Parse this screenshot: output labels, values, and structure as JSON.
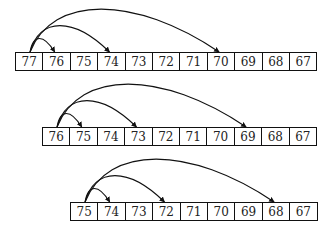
{
  "diagram": {
    "type": "array-jump-arcs",
    "cell_width": 27.4,
    "cell_height": 19,
    "colors": {
      "stroke": "#111111",
      "text": "#222222",
      "background": "#ffffff"
    },
    "rows": [
      {
        "x": 15,
        "y": 52,
        "values": [
          "77",
          "76",
          "75",
          "74",
          "73",
          "72",
          "71",
          "70",
          "69",
          "68",
          "67"
        ],
        "arcs_from_index": 0,
        "arcs_to_index": [
          1,
          3,
          7
        ]
      },
      {
        "x": 42,
        "y": 127,
        "values": [
          "76",
          "75",
          "74",
          "73",
          "72",
          "71",
          "70",
          "69",
          "68",
          "67"
        ],
        "arcs_from_index": 0,
        "arcs_to_index": [
          1,
          3,
          7
        ]
      },
      {
        "x": 70,
        "y": 202,
        "values": [
          "75",
          "74",
          "73",
          "72",
          "71",
          "70",
          "69",
          "68",
          "67"
        ],
        "arcs_from_index": 0,
        "arcs_to_index": [
          1,
          3,
          7
        ]
      }
    ]
  }
}
